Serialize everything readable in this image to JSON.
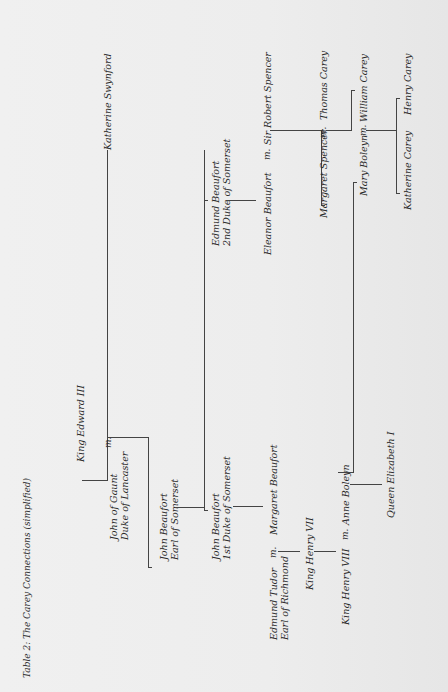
{
  "title": "Table 2: The Carey Connections (simplified)",
  "marriage_marker": "m.",
  "people": {
    "edward_iii": "King Edward III",
    "john_of_gaunt": [
      "John of Gaunt",
      "Duke of Lancaster"
    ],
    "katherine_swynford": "Katherine Swynford",
    "john_beaufort_earl": [
      "John Beaufort",
      "Earl of Somerset"
    ],
    "john_beaufort_duke": [
      "John Beaufort",
      "1st Duke of Somerset"
    ],
    "edmund_beaufort": [
      "Edmund Beaufort",
      "2nd Duke of Somerset"
    ],
    "edmund_tudor": [
      "Edmund Tudor",
      "Earl of Richmond"
    ],
    "margaret_beaufort": "Margaret Beaufort",
    "henry_vii": "King Henry VII",
    "henry_viii": "King Henry VIII",
    "anne_boleyn": "Anne Boleyn",
    "elizabeth_i": "Queen Elizabeth I",
    "eleanor_beaufort": "Eleanor Beaufort",
    "robert_spencer": "Sir Robert Spencer",
    "margaret_spencer": "Margaret Spencer",
    "thomas_carey": "Thomas Carey",
    "mary_boleyn": "Mary Boleyn",
    "william_carey": "William Carey",
    "katherine_carey": "Katherine Carey",
    "henry_carey": "Henry Carey"
  },
  "colors": {
    "paper": "#ececec",
    "ink": "#2b2b2b",
    "line": "#444444"
  }
}
